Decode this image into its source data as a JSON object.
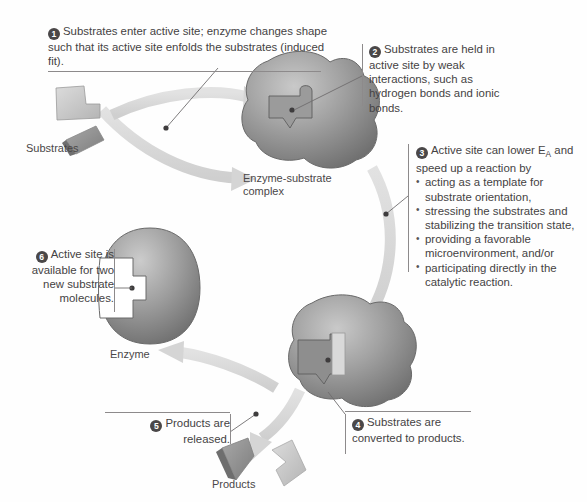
{
  "figure": {
    "background_color": "#fefefe",
    "accent_color": "#8d8a8b",
    "badge_color": "#4a4748",
    "blob_color": "#8f8f8f"
  },
  "callouts": [
    {
      "id": "1",
      "number": "1",
      "text": "Substrates enter active site; enzyme changes shape such that its active site enfolds the substrates (induced fit)."
    },
    {
      "id": "2",
      "number": "2",
      "text": "Substrates are held in active site by weak interactions, such as hydrogen bonds and ionic bonds."
    },
    {
      "id": "3",
      "number": "3",
      "lead_a": "Active site can lower E",
      "lead_sub": "A",
      "lead_b": " and speed up a reaction by",
      "bullets": [
        "acting as a template for substrate orientation,",
        "stressing the substrates and stabilizing the transition state,",
        "providing a favorable microenvironment, and/or",
        "participating directly in the catalytic reaction."
      ]
    },
    {
      "id": "4",
      "number": "4",
      "text": "Substrates are converted to products."
    },
    {
      "id": "5",
      "number": "5",
      "text": "Products are released."
    },
    {
      "id": "6",
      "number": "6",
      "text": "Active site is available for two new substrate molecules."
    }
  ],
  "captions": {
    "substrates": "Substrates",
    "complex_line1": "Enzyme-substrate",
    "complex_line2": "complex",
    "enzyme": "Enzyme",
    "products": "Products"
  }
}
